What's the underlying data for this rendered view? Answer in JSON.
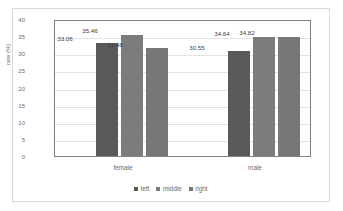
{
  "chart_data": {
    "type": "bar",
    "title": "",
    "xlabel": "",
    "ylabel": "rate (%)",
    "ylim": [
      0,
      40
    ],
    "ytick_step": 5,
    "yticks": [
      "40",
      "35",
      "30",
      "25",
      "20",
      "15",
      "10",
      "5",
      "0"
    ],
    "grid": true,
    "legend_position": "bottom",
    "categories": [
      "female",
      "male"
    ],
    "series": [
      {
        "name": "left",
        "color": "#595959",
        "values": [
          33.06,
          30.55
        ],
        "labels": [
          "33.06",
          "30.55"
        ]
      },
      {
        "name": "middle",
        "color": "#7c7c7c",
        "values": [
          35.46,
          34.64
        ],
        "labels": [
          "35.46",
          "34.64"
        ]
      },
      {
        "name": "right",
        "color": "#777777",
        "values": [
          31.48,
          34.82
        ],
        "labels": [
          "31.48",
          "34.82"
        ]
      }
    ]
  }
}
